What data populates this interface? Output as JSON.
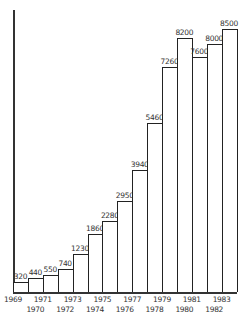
{
  "chart_data": {
    "type": "bar",
    "title": "",
    "xlabel": "",
    "ylabel": "",
    "categories": [
      "1969",
      "1970",
      "1971",
      "1972",
      "1973",
      "1974",
      "1975",
      "1976",
      "1977",
      "1978",
      "1979",
      "1980",
      "1981",
      "1982",
      "1983"
    ],
    "values": [
      320,
      440,
      550,
      740,
      1230,
      1860,
      2280,
      2950,
      3940,
      5460,
      7260,
      8200,
      7600,
      8000,
      8500
    ],
    "value_labels": [
      "320",
      "440",
      "550",
      "740",
      "1230",
      "1860",
      "2280",
      "2950",
      "3940",
      "5460",
      "7260",
      "8200",
      "7600",
      "8000",
      "8500"
    ],
    "ylim": [
      0,
      8500
    ],
    "grid": false,
    "legend": null,
    "style": {
      "bar_fill": "#ffffff",
      "bar_stroke": "#222222",
      "adjacent_bars": true,
      "x_labels_staggered": true
    }
  }
}
